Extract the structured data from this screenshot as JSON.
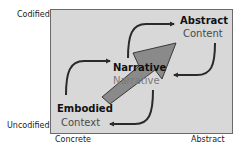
{
  "axes": {
    "y_top": "Codified",
    "y_bottom": "Uncodified",
    "x_left": "Concrete",
    "x_right": "Abstract"
  },
  "nodes": {
    "abstract": {
      "title": "Abstract",
      "subtitle": "Content"
    },
    "narrative": {
      "title": "Narrative",
      "subtitle": "Narrative"
    },
    "embodied": {
      "title": "Embodied",
      "subtitle": "Context"
    }
  },
  "colors": {
    "box_fill": "#d8d8d8",
    "box_border": "#6a6a6a",
    "big_arrow_fill": "#8a8a8a",
    "curve_stroke": "#2a2a2a"
  }
}
